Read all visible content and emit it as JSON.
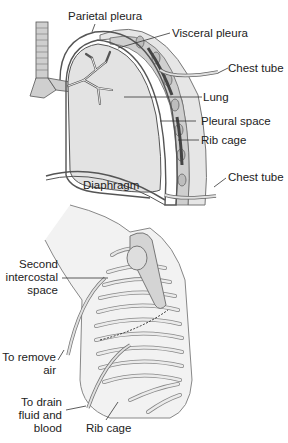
{
  "figure": {
    "type": "medical-illustration"
  },
  "top_diagram": {
    "labels": {
      "parietal_pleura": "Parietal pleura",
      "visceral_pleura": "Visceral pleura",
      "chest_tube_upper": "Chest tube",
      "lung": "Lung",
      "pleural_space": "Pleural space",
      "rib_cage": "Rib cage",
      "chest_tube_lower": "Chest tube",
      "diaphragm": "Diaphragm"
    }
  },
  "bottom_diagram": {
    "labels": {
      "second_intercostal_1": "Second",
      "second_intercostal_2": "intercostal",
      "second_intercostal_3": "space",
      "remove_air_1": "To remove",
      "remove_air_2": "air",
      "drain_1": "To drain",
      "drain_2": "fluid and",
      "drain_3": "blood",
      "rib_cage": "Rib cage"
    }
  },
  "colors": {
    "lung_fill": "#e3e3e3",
    "pleura_stroke": "#555555",
    "chest_wall": "#d6d6d6",
    "rib_dark": "#6a6a6a",
    "tube": "#cfcfcf"
  }
}
